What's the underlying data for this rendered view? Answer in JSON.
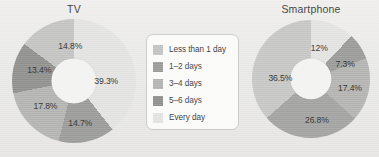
{
  "background_color": "#ebebea",
  "legend": {
    "name": "chart-legend",
    "items": [
      {
        "label": "Less than 1 day",
        "color": "#c3c3c1"
      },
      {
        "label": "1–2 days",
        "color": "#9a9a98"
      },
      {
        "label": "3–4 days",
        "color": "#b3b3b1"
      },
      {
        "label": "5–6 days",
        "color": "#8f8f8d"
      },
      {
        "label": "Every day",
        "color": "#e3e3e1"
      }
    ]
  },
  "chart_data": [
    {
      "type": "pie",
      "variant": "donut",
      "title": "TV",
      "xlabel": "",
      "ylabel": "",
      "start_angle_deg": 0,
      "direction": "clockwise",
      "categories": [
        "Every day",
        "1–2 days",
        "3–4 days",
        "5–6 days",
        "Less than 1 day"
      ],
      "values": [
        39.3,
        14.7,
        17.8,
        13.4,
        14.8
      ],
      "labels": [
        "39.3%",
        "14.7%",
        "17.8%",
        "13.4%",
        "14.8%"
      ],
      "colors": [
        "#e3e3e1",
        "#9a9a98",
        "#b3b3b1",
        "#8f8f8d",
        "#c3c3c1"
      ],
      "label_positions": [
        {
          "x": 76,
          "y": 50
        },
        {
          "x": 55,
          "y": 84
        },
        {
          "x": 27,
          "y": 70
        },
        {
          "x": 22,
          "y": 41
        },
        {
          "x": 47,
          "y": 22
        }
      ]
    },
    {
      "type": "pie",
      "variant": "donut",
      "title": "Smartphone",
      "xlabel": "",
      "ylabel": "",
      "start_angle_deg": 0,
      "direction": "clockwise",
      "categories": [
        "Less than 1 day",
        "1–2 days",
        "3–4 days",
        "5–6 days",
        "Every day"
      ],
      "values": [
        12.0,
        7.3,
        17.4,
        26.8,
        36.5
      ],
      "labels": [
        "12%",
        "7.3%",
        "17.4%",
        "26.8%",
        "36.5%"
      ],
      "colors": [
        "#e3e3e1",
        "#9a9a98",
        "#b3b3b1",
        "#a2a2a0",
        "#c6c6c4"
      ],
      "label_positions": [
        {
          "x": 57,
          "y": 24
        },
        {
          "x": 79,
          "y": 37
        },
        {
          "x": 83,
          "y": 58
        },
        {
          "x": 55,
          "y": 85
        },
        {
          "x": 24,
          "y": 49
        }
      ]
    }
  ]
}
